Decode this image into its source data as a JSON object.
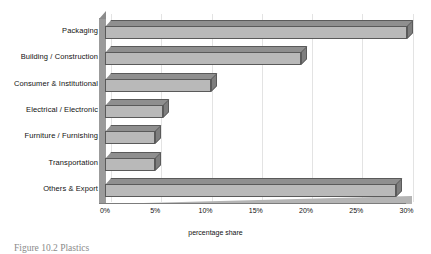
{
  "chart_data": {
    "type": "bar",
    "orientation": "horizontal",
    "title": "",
    "xlabel": "percentage share",
    "ylabel": "",
    "categories": [
      "Packaging",
      "Building / Construction",
      "Consumer & Institutional",
      "Electrical / Electronic",
      "Furniture / Furnishing",
      "Transportation",
      "Others & Export"
    ],
    "values": [
      30.0,
      19.5,
      10.5,
      5.8,
      5.0,
      5.0,
      29.0
    ],
    "xlim": [
      0,
      30
    ],
    "xticks": [
      0,
      5,
      10,
      15,
      20,
      25,
      30
    ],
    "xtick_labels": [
      "0%",
      "5%",
      "10%",
      "15%",
      "20%",
      "25%",
      "30%"
    ],
    "grid": true,
    "legend": "none",
    "style": "3d-grayscale"
  },
  "caption": {
    "text": "Figure 10.2 Plastics"
  },
  "colors": {
    "bar_front": "#b9b9b9",
    "bar_top": "#8f8f8f",
    "bar_cap": "#7e7e7e",
    "outline": "#5a5a5a",
    "wall": "#9b9b9b",
    "gridline": "#e3e3e3",
    "text": "#111111"
  }
}
